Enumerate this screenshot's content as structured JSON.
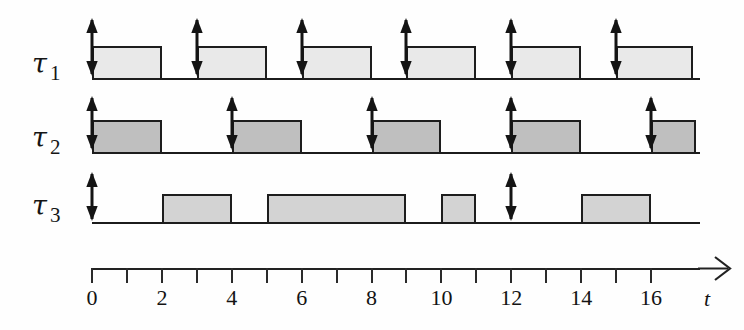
{
  "figure": {
    "kind": "gantt-schedule"
  },
  "rows": [
    {
      "id": "tau1",
      "tau_symbol": "τ",
      "index": "1",
      "label": "τ 1",
      "fill_color": "#e9e9e9",
      "baseline_y": 78,
      "block_height": 34,
      "arrow_top": 18,
      "arrow_height": 58,
      "releases": [
        0,
        3,
        6,
        9,
        12,
        15
      ],
      "blocks": [
        {
          "start": 0,
          "end": 2
        },
        {
          "start": 3,
          "end": 5
        },
        {
          "start": 6,
          "end": 8
        },
        {
          "start": 9,
          "end": 11
        },
        {
          "start": 12,
          "end": 14
        },
        {
          "start": 15,
          "end": 17.2
        }
      ]
    },
    {
      "id": "tau2",
      "tau_symbol": "τ",
      "index": "2",
      "label": "τ 2",
      "fill_color": "#bfbfbf",
      "baseline_y": 152,
      "block_height": 34,
      "arrow_top": 96,
      "arrow_height": 54,
      "releases": [
        0,
        4,
        8,
        12,
        16
      ],
      "blocks": [
        {
          "start": 0,
          "end": 2
        },
        {
          "start": 4,
          "end": 6
        },
        {
          "start": 8,
          "end": 10
        },
        {
          "start": 12,
          "end": 14
        },
        {
          "start": 16,
          "end": 17.3
        }
      ]
    },
    {
      "id": "tau3",
      "tau_symbol": "τ",
      "index": "3",
      "label": "τ 3",
      "fill_color": "#d3d3d3",
      "baseline_y": 222,
      "block_height": 30,
      "arrow_top": 172,
      "arrow_height": 49,
      "releases": [
        0,
        12
      ],
      "blocks": [
        {
          "start": 2,
          "end": 4
        },
        {
          "start": 5,
          "end": 9
        },
        {
          "start": 10,
          "end": 11
        },
        {
          "start": 14,
          "end": 16
        }
      ]
    }
  ],
  "axis": {
    "variable_label": "t",
    "y": 268,
    "t_min": 0,
    "t_max": 17.4,
    "tick_step": 1,
    "tick_length": 15,
    "labeled_ticks": [
      {
        "value": 0,
        "text": "0"
      },
      {
        "value": 2,
        "text": "2"
      },
      {
        "value": 4,
        "text": "4"
      },
      {
        "value": 6,
        "text": "6"
      },
      {
        "value": 8,
        "text": "8"
      },
      {
        "value": 10,
        "text": "10"
      },
      {
        "value": 12,
        "text": "12"
      },
      {
        "value": 14,
        "text": "14"
      },
      {
        "value": 16,
        "text": "16"
      }
    ],
    "label_y": 285,
    "has_end_arrow": true
  },
  "geometry": {
    "origin_x": 92,
    "unit_px": 34.94,
    "label_x": 32,
    "row_label_offsets": [
      48,
      122,
      190
    ],
    "baseline_right_extent": 700
  },
  "colors": {
    "ink": "#1b1b1b",
    "background": "#fefefe",
    "tau1_fill": "#e9e9e9",
    "tau2_fill": "#bfbfbf",
    "tau3_fill": "#d3d3d3"
  },
  "chart_data": {
    "type": "gantt",
    "xlabel": "t",
    "xlim": [
      0,
      17.4
    ],
    "x_tick_step": 1,
    "x_labeled_ticks": [
      0,
      2,
      4,
      6,
      8,
      10,
      12,
      14,
      16
    ],
    "grid": false,
    "legend": null,
    "series": [
      {
        "name": "τ 1",
        "fill": "#e9e9e9",
        "release_times": [
          0,
          3,
          6,
          9,
          12,
          15
        ],
        "intervals": [
          [
            0,
            2
          ],
          [
            3,
            5
          ],
          [
            6,
            8
          ],
          [
            9,
            11
          ],
          [
            12,
            14
          ],
          [
            15,
            17.2
          ]
        ]
      },
      {
        "name": "τ 2",
        "fill": "#bfbfbf",
        "release_times": [
          0,
          4,
          8,
          12,
          16
        ],
        "intervals": [
          [
            0,
            2
          ],
          [
            4,
            6
          ],
          [
            8,
            10
          ],
          [
            12,
            14
          ],
          [
            16,
            17.3
          ]
        ]
      },
      {
        "name": "τ 3",
        "fill": "#d3d3d3",
        "release_times": [
          0,
          12
        ],
        "intervals": [
          [
            2,
            4
          ],
          [
            5,
            9
          ],
          [
            10,
            11
          ],
          [
            14,
            16
          ]
        ]
      }
    ]
  }
}
